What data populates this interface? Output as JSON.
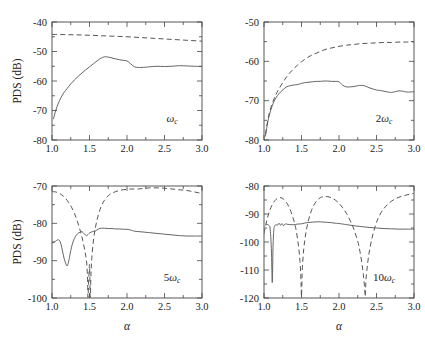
{
  "figure": {
    "y_axis_title": "PDS (dB)",
    "x_axis_title": "α",
    "width": 425,
    "height": 340,
    "line_color": "#555555",
    "text_color": "#222222"
  },
  "chart_data": [
    {
      "type": "line",
      "id": "panel-omega-c",
      "position": "top-left",
      "title": "",
      "annotation": "ω_c",
      "annotation_base": "ω",
      "annotation_sub": "c",
      "annotation_prefix": "",
      "xlabel": "α",
      "ylabel": "PDS (dB)",
      "xlim": [
        1.0,
        3.0
      ],
      "ylim": [
        -80,
        -40
      ],
      "xticks": [
        1.0,
        1.5,
        2.0,
        2.5,
        3.0
      ],
      "xticklabels": [
        "1.0",
        "1.5",
        "2.0",
        "2.5",
        "3.0"
      ],
      "yticks": [
        -80,
        -70,
        -60,
        -50,
        -40
      ],
      "yticklabels": [
        "-80",
        "-70",
        "-60",
        "-50",
        "-40"
      ],
      "yminor": [
        -75,
        -65,
        -55,
        -45
      ],
      "xminor": [
        1.25,
        1.75,
        2.25,
        2.75
      ],
      "grid": false,
      "legend": "none",
      "series": [
        {
          "name": "solid",
          "style": "solid",
          "x": [
            1.02,
            1.05,
            1.08,
            1.12,
            1.16,
            1.2,
            1.25,
            1.3,
            1.35,
            1.4,
            1.45,
            1.5,
            1.55,
            1.6,
            1.65,
            1.7,
            1.75,
            1.8,
            1.85,
            1.9,
            1.95,
            2.0,
            2.05,
            2.1,
            2.15,
            2.2,
            2.3,
            2.4,
            2.5,
            2.6,
            2.7,
            2.8,
            2.9,
            3.0
          ],
          "y": [
            -72.8,
            -70.0,
            -67.8,
            -65.6,
            -63.9,
            -62.6,
            -61.0,
            -59.6,
            -58.4,
            -57.3,
            -56.2,
            -55.2,
            -54.2,
            -53.2,
            -52.3,
            -51.8,
            -51.9,
            -52.2,
            -52.5,
            -52.8,
            -53.0,
            -53.2,
            -54.2,
            -55.2,
            -55.4,
            -55.4,
            -55.2,
            -55.0,
            -55.1,
            -55.0,
            -54.8,
            -54.9,
            -55.0,
            -55.1
          ]
        },
        {
          "name": "dashed",
          "style": "dashed",
          "x": [
            1.0,
            1.2,
            1.4,
            1.6,
            1.8,
            2.0,
            2.2,
            2.4,
            2.6,
            2.8,
            3.0
          ],
          "y": [
            -44.2,
            -44.3,
            -44.4,
            -44.6,
            -44.8,
            -45.0,
            -45.3,
            -45.6,
            -45.9,
            -46.2,
            -46.5
          ]
        }
      ]
    },
    {
      "type": "line",
      "id": "panel-2omega-c",
      "position": "top-right",
      "title": "",
      "annotation": "2ω_c",
      "annotation_base": "ω",
      "annotation_sub": "c",
      "annotation_prefix": "2",
      "xlabel": "α",
      "ylabel": "",
      "xlim": [
        1.0,
        3.0
      ],
      "ylim": [
        -80,
        -50
      ],
      "xticks": [
        1.0,
        1.5,
        2.0,
        2.5,
        3.0
      ],
      "xticklabels": [
        "1.0",
        "1.5",
        "2.0",
        "2.5",
        "3.0"
      ],
      "yticks": [
        -80,
        -70,
        -60,
        -50
      ],
      "yticklabels": [
        "-80",
        "-70",
        "-60",
        "-50"
      ],
      "yminor": [
        -75,
        -65,
        -55
      ],
      "xminor": [
        1.25,
        1.75,
        2.25,
        2.75
      ],
      "grid": false,
      "legend": "none",
      "series": [
        {
          "name": "solid",
          "style": "solid",
          "x": [
            1.02,
            1.04,
            1.06,
            1.09,
            1.12,
            1.15,
            1.18,
            1.22,
            1.26,
            1.3,
            1.35,
            1.4,
            1.45,
            1.5,
            1.55,
            1.6,
            1.65,
            1.7,
            1.75,
            1.8,
            1.85,
            1.9,
            1.95,
            2.0,
            2.05,
            2.1,
            2.15,
            2.2,
            2.25,
            2.3,
            2.35,
            2.4,
            2.45,
            2.5,
            2.55,
            2.6,
            2.65,
            2.7,
            2.75,
            2.8,
            2.85,
            2.9,
            2.95,
            3.0
          ],
          "y": [
            -79.0,
            -76.5,
            -74.5,
            -72.4,
            -70.8,
            -69.6,
            -68.7,
            -67.8,
            -67.1,
            -66.5,
            -66.2,
            -66.0,
            -65.9,
            -65.6,
            -65.4,
            -65.3,
            -65.2,
            -65.1,
            -65.1,
            -65.0,
            -65.0,
            -65.1,
            -65.1,
            -65.2,
            -66.1,
            -66.5,
            -66.5,
            -66.4,
            -66.2,
            -66.1,
            -66.3,
            -66.7,
            -67.0,
            -67.3,
            -67.4,
            -67.6,
            -67.8,
            -67.9,
            -67.7,
            -67.5,
            -67.6,
            -67.8,
            -67.8,
            -67.7
          ]
        },
        {
          "name": "dashed",
          "style": "dashed",
          "x": [
            1.02,
            1.05,
            1.08,
            1.12,
            1.16,
            1.2,
            1.25,
            1.3,
            1.35,
            1.4,
            1.45,
            1.5,
            1.55,
            1.6,
            1.65,
            1.7,
            1.75,
            1.8,
            1.85,
            1.9,
            1.95,
            2.0,
            2.1,
            2.2,
            2.3,
            2.4,
            2.5,
            2.6,
            2.7,
            2.8,
            2.9,
            3.0
          ],
          "y": [
            -78.5,
            -75.0,
            -72.5,
            -70.2,
            -68.4,
            -67.0,
            -65.4,
            -64.0,
            -62.8,
            -61.8,
            -60.9,
            -60.1,
            -59.4,
            -58.8,
            -58.3,
            -57.9,
            -57.5,
            -57.1,
            -56.8,
            -56.6,
            -56.4,
            -56.2,
            -55.9,
            -55.7,
            -55.5,
            -55.4,
            -55.3,
            -55.2,
            -55.2,
            -55.1,
            -55.1,
            -55.0
          ]
        }
      ]
    },
    {
      "type": "line",
      "id": "panel-5omega-c",
      "position": "bottom-left",
      "title": "",
      "annotation": "5ω_c",
      "annotation_base": "ω",
      "annotation_sub": "c",
      "annotation_prefix": "5",
      "xlabel": "α",
      "ylabel": "PDS (dB)",
      "xlim": [
        1.0,
        3.0
      ],
      "ylim": [
        -100,
        -70
      ],
      "xticks": [
        1.0,
        1.5,
        2.0,
        2.5,
        3.0
      ],
      "xticklabels": [
        "1.0",
        "1.5",
        "2.0",
        "2.5",
        "3.0"
      ],
      "yticks": [
        -100,
        -90,
        -80,
        -70
      ],
      "yticklabels": [
        "-100",
        "-90",
        "-80",
        "-70"
      ],
      "yminor": [
        -95,
        -85,
        -75
      ],
      "xminor": [
        1.25,
        1.75,
        2.25,
        2.75
      ],
      "grid": false,
      "legend": "none",
      "series": [
        {
          "name": "solid",
          "style": "solid",
          "x": [
            1.0,
            1.03,
            1.06,
            1.08,
            1.1,
            1.12,
            1.14,
            1.16,
            1.18,
            1.2,
            1.22,
            1.24,
            1.26,
            1.28,
            1.3,
            1.32,
            1.34,
            1.36,
            1.38,
            1.4,
            1.43,
            1.46,
            1.5,
            1.54,
            1.58,
            1.62,
            1.66,
            1.7,
            1.75,
            1.8,
            1.85,
            1.9,
            1.95,
            2.0,
            2.05,
            2.1,
            2.2,
            2.3,
            2.4,
            2.5,
            2.6,
            2.7,
            2.8,
            2.9,
            3.0
          ],
          "y": [
            -85.3,
            -85.0,
            -84.6,
            -84.4,
            -84.6,
            -85.6,
            -87.4,
            -89.3,
            -90.6,
            -91.4,
            -90.4,
            -88.3,
            -86.4,
            -85.0,
            -84.0,
            -83.3,
            -82.8,
            -82.5,
            -82.3,
            -82.2,
            -82.8,
            -83.3,
            -82.6,
            -82.2,
            -82.0,
            -81.5,
            -81.3,
            -81.3,
            -81.4,
            -81.4,
            -81.5,
            -81.5,
            -81.6,
            -81.6,
            -81.8,
            -82.1,
            -82.3,
            -82.5,
            -82.7,
            -82.9,
            -83.1,
            -83.3,
            -83.4,
            -83.4,
            -83.4
          ]
        },
        {
          "name": "dashed",
          "style": "dashed",
          "x": [
            1.0,
            1.05,
            1.1,
            1.15,
            1.2,
            1.25,
            1.3,
            1.34,
            1.38,
            1.41,
            1.44,
            1.46,
            1.47,
            1.475,
            1.48,
            1.49,
            1.5,
            1.505,
            1.51,
            1.52,
            1.53,
            1.55,
            1.58,
            1.62,
            1.66,
            1.7,
            1.75,
            1.8,
            1.85,
            1.9,
            1.95,
            2.0,
            2.05,
            2.1,
            2.15,
            2.2,
            2.25,
            2.3,
            2.35,
            2.4,
            2.45,
            2.5,
            2.55,
            2.6,
            2.65,
            2.7,
            2.75,
            2.8,
            2.85,
            2.9,
            2.95,
            3.0
          ],
          "y": [
            -71.5,
            -71.6,
            -72.0,
            -72.7,
            -73.8,
            -75.3,
            -77.4,
            -79.6,
            -82.2,
            -84.6,
            -87.5,
            -90.0,
            -93.0,
            -96.0,
            -99.8,
            -95.0,
            -91.0,
            -95.0,
            -99.8,
            -93.5,
            -89.5,
            -85.0,
            -81.0,
            -77.6,
            -75.3,
            -73.8,
            -72.6,
            -71.9,
            -71.5,
            -71.2,
            -71.0,
            -70.9,
            -70.8,
            -70.8,
            -70.8,
            -70.7,
            -70.6,
            -70.5,
            -70.5,
            -70.5,
            -70.5,
            -70.6,
            -70.7,
            -70.8,
            -70.9,
            -71.0,
            -71.1,
            -71.2,
            -71.4,
            -71.6,
            -71.8,
            -72.0
          ]
        }
      ]
    },
    {
      "type": "line",
      "id": "panel-10omega-c",
      "position": "bottom-right",
      "title": "",
      "annotation": "10ω_c",
      "annotation_base": "ω",
      "annotation_sub": "c",
      "annotation_prefix": "10",
      "xlabel": "α",
      "ylabel": "",
      "xlim": [
        1.0,
        3.0
      ],
      "ylim": [
        -120,
        -80
      ],
      "xticks": [
        1.0,
        1.5,
        2.0,
        2.5,
        3.0
      ],
      "xticklabels": [
        "1.0",
        "1.5",
        "2.0",
        "2.5",
        "3.0"
      ],
      "yticks": [
        -120,
        -110,
        -100,
        -90,
        -80
      ],
      "yticklabels": [
        "-120",
        "-110",
        "-100",
        "-90",
        "-80"
      ],
      "yminor": [
        -115,
        -105,
        -95,
        -85
      ],
      "xminor": [
        1.25,
        1.75,
        2.25,
        2.75
      ],
      "grid": false,
      "legend": "none",
      "series": [
        {
          "name": "solid",
          "style": "solid",
          "x": [
            1.03,
            1.05,
            1.07,
            1.08,
            1.09,
            1.1,
            1.105,
            1.11,
            1.115,
            1.12,
            1.13,
            1.14,
            1.16,
            1.18,
            1.2,
            1.22,
            1.24,
            1.26,
            1.28,
            1.3,
            1.32,
            1.34,
            1.36,
            1.38,
            1.4,
            1.45,
            1.5,
            1.55,
            1.6,
            1.65,
            1.7,
            1.75,
            1.8,
            1.85,
            1.9,
            1.95,
            2.0,
            2.1,
            2.2,
            2.3,
            2.4,
            2.5,
            2.6,
            2.7,
            2.8,
            2.9,
            3.0
          ],
          "y": [
            -93.6,
            -93.8,
            -94.2,
            -95.0,
            -98.0,
            -104.0,
            -110.0,
            -114.5,
            -110.0,
            -102.0,
            -96.0,
            -94.4,
            -93.8,
            -94.0,
            -93.3,
            -94.0,
            -93.4,
            -94.2,
            -93.6,
            -93.6,
            -93.7,
            -93.8,
            -93.8,
            -93.8,
            -93.8,
            -93.6,
            -93.5,
            -93.2,
            -93.0,
            -92.9,
            -92.8,
            -92.8,
            -92.9,
            -93.0,
            -93.1,
            -93.3,
            -93.4,
            -93.8,
            -94.2,
            -94.5,
            -94.8,
            -95.0,
            -95.2,
            -95.3,
            -95.4,
            -95.4,
            -95.4
          ]
        },
        {
          "name": "dashed",
          "style": "dashed",
          "x": [
            1.0,
            1.04,
            1.08,
            1.12,
            1.16,
            1.2,
            1.24,
            1.28,
            1.32,
            1.36,
            1.4,
            1.43,
            1.46,
            1.48,
            1.49,
            1.495,
            1.5,
            1.505,
            1.51,
            1.53,
            1.56,
            1.6,
            1.65,
            1.7,
            1.75,
            1.8,
            1.85,
            1.9,
            1.95,
            2.0,
            2.05,
            2.1,
            2.15,
            2.2,
            2.25,
            2.28,
            2.31,
            2.33,
            2.34,
            2.345,
            2.35,
            2.355,
            2.36,
            2.38,
            2.41,
            2.45,
            2.5,
            2.55,
            2.6,
            2.65,
            2.7,
            2.75,
            2.8,
            2.85,
            2.9,
            2.95,
            3.0
          ],
          "y": [
            -97.0,
            -92.0,
            -88.5,
            -86.2,
            -84.8,
            -84.2,
            -84.3,
            -85.2,
            -86.8,
            -89.2,
            -92.5,
            -96.0,
            -101.5,
            -107.0,
            -112.0,
            -116.0,
            -119.5,
            -115.0,
            -110.0,
            -102.5,
            -96.5,
            -91.5,
            -87.6,
            -85.4,
            -84.2,
            -83.8,
            -83.8,
            -84.2,
            -85.0,
            -86.2,
            -87.8,
            -89.8,
            -92.4,
            -95.6,
            -99.8,
            -103.5,
            -108.5,
            -113.0,
            -116.0,
            -118.0,
            -119.5,
            -117.0,
            -113.5,
            -108.0,
            -102.5,
            -97.5,
            -93.0,
            -90.0,
            -88.0,
            -86.5,
            -85.4,
            -84.6,
            -84.0,
            -83.6,
            -83.2,
            -82.9,
            -82.6
          ]
        }
      ]
    }
  ]
}
